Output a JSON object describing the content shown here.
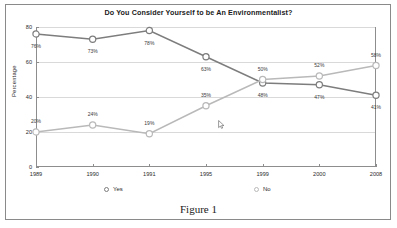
{
  "figure": {
    "caption": "Figure 1"
  },
  "chart_data": {
    "type": "line",
    "title": "Do You Consider Yourself to be An Environmentalist?",
    "xlabel": "",
    "ylabel": "Percentage",
    "categories": [
      "1989",
      "1990",
      "1991",
      "1995",
      "1999",
      "2000",
      "2008"
    ],
    "ylim": [
      0,
      80
    ],
    "yticks": [
      0,
      20,
      40,
      60,
      80
    ],
    "ytick_labels": [
      "0",
      "20",
      "40",
      "60",
      "80"
    ],
    "grid": true,
    "legend_position": "bottom",
    "series": [
      {
        "name": "Yes",
        "color": "#7d7d7d",
        "values": [
          76,
          73,
          78,
          63,
          48,
          47,
          41
        ],
        "labels": [
          "76%",
          "73%",
          "78%",
          "63%",
          "48%",
          "47%",
          "41%"
        ]
      },
      {
        "name": "No",
        "color": "#b9b9b9",
        "values": [
          20,
          24,
          19,
          35,
          50,
          52,
          58
        ],
        "labels": [
          "20%",
          "24%",
          "19%",
          "35%",
          "50%",
          "52%",
          "58%"
        ]
      }
    ]
  }
}
